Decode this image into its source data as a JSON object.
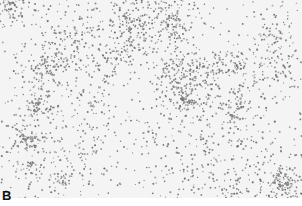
{
  "figure": {
    "panel_label": "B",
    "colors": {
      "background": "#f4f4f4",
      "cells": "#8a8a8a"
    }
  }
}
